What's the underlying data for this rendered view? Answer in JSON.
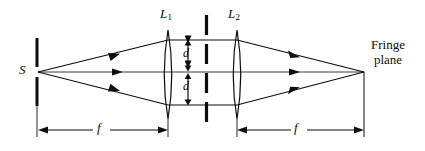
{
  "figure": {
    "type": "optical-ray-diagram",
    "title_text": null,
    "background_color": "#ffffff",
    "ink_color": "#0d0d0d",
    "width": 425,
    "height": 151
  },
  "labels": {
    "source": "S",
    "lens1": "L",
    "lens1_subscript": "1",
    "lens2": "L",
    "lens2_subscript": "2",
    "separation_top": "d",
    "separation_bottom": "d",
    "focal_left": "f",
    "focal_right": "f",
    "screen_line1": "Fringe",
    "screen_line2": "plane"
  },
  "elements": {
    "source_slit": {
      "name": "source-slit",
      "x": 37,
      "y_top": 38,
      "y_bottom": 106,
      "gap_top": 68,
      "gap_bottom": 76,
      "stroke_width": 3
    },
    "lens1": {
      "name": "converging-lens-L1",
      "x": 168,
      "y_top": 30,
      "y_bottom": 119,
      "half_width": 6
    },
    "lens2": {
      "name": "converging-lens-L2",
      "x": 237,
      "y_top": 30,
      "y_bottom": 119,
      "half_width": 6
    },
    "aperture_mask": {
      "name": "double-slit-mask",
      "x": 206,
      "y_top": 15,
      "y_bottom": 126,
      "dash_pattern": "20 9",
      "stroke_width": 3
    },
    "fringe_plane_line": {
      "name": "fringe-plane-line",
      "x": 364,
      "y_top": 72,
      "y_bottom": 137
    },
    "optical_axis": {
      "y": 72,
      "x_start": 38,
      "x_end": 364
    }
  },
  "rays": {
    "upper_offset": 40,
    "lower_offset": 105,
    "source_x": 38,
    "focus_x": 364,
    "arrow_positions": [
      118,
      295
    ]
  },
  "dimensions": {
    "left": {
      "name": "focal-length-left",
      "x_start": 38,
      "x_end": 168,
      "y": 130,
      "label": "f"
    },
    "right": {
      "name": "focal-length-right",
      "x_start": 237,
      "x_end": 364,
      "y": 130,
      "label": "f"
    }
  },
  "separations": {
    "top": {
      "x": 188,
      "y_start": 40,
      "y_end": 71,
      "label": "d"
    },
    "bottom": {
      "x": 188,
      "y_start": 73,
      "y_end": 105,
      "label": "d"
    }
  }
}
